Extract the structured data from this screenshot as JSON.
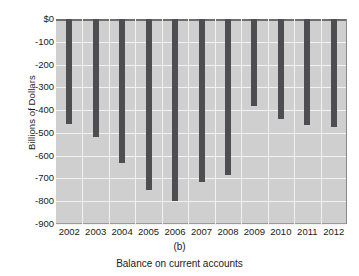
{
  "chart_data": {
    "type": "bar",
    "title": "",
    "panel_letter": "(b)",
    "caption": "Balance on current accounts",
    "xlabel": "",
    "ylabel": "Billions of Dollars",
    "categories": [
      "2002",
      "2003",
      "2004",
      "2005",
      "2006",
      "2007",
      "2008",
      "2009",
      "2010",
      "2011",
      "2012"
    ],
    "values": [
      -460,
      -520,
      -630,
      -750,
      -800,
      -715,
      -685,
      -380,
      -440,
      -465,
      -475
    ],
    "ylim": [
      -900,
      0
    ],
    "ytick_labels": [
      "$0",
      "-100",
      "-200",
      "-300",
      "-400",
      "-500",
      "-600",
      "-700",
      "-800",
      "-900"
    ],
    "ytick_values": [
      0,
      -100,
      -200,
      -300,
      -400,
      -500,
      -600,
      -700,
      -800,
      -900
    ],
    "grid": true,
    "legend": "none",
    "bar_color": "#4d4d52",
    "plot_background": "#cfcfcf",
    "gridline_color": "#f2f2f2"
  }
}
